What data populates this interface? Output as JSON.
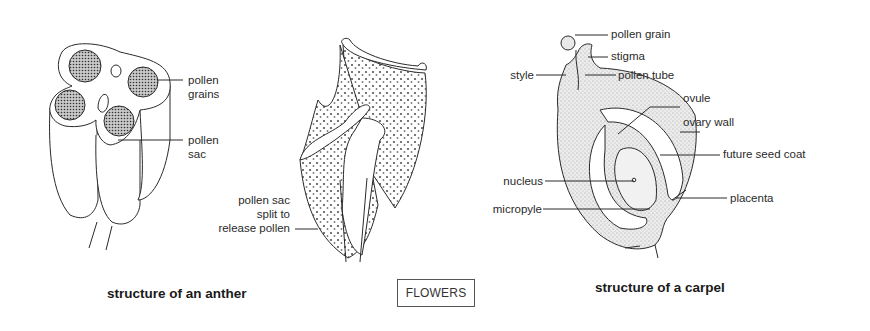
{
  "section_tag": "FLOWERS",
  "figures": [
    {
      "id": "anther",
      "caption": "structure of an anther",
      "labels": {
        "pollen_grains": [
          "pollen",
          "grains"
        ],
        "pollen_sac": [
          "pollen",
          "sac"
        ]
      }
    },
    {
      "id": "dehisced-anther",
      "caption": "",
      "labels": {
        "split": [
          "pollen sac",
          "split to",
          "release pollen"
        ]
      }
    },
    {
      "id": "carpel",
      "caption": "structure of a carpel",
      "labels": {
        "pollen_grain": "pollen grain",
        "stigma": "stigma",
        "style": "style",
        "pollen_tube": "pollen tube",
        "ovule": "ovule",
        "ovary_wall": "ovary wall",
        "future_seed_coat": "future seed coat",
        "nucleus": "nucleus",
        "placenta": "placenta",
        "micropyle": "micropyle"
      }
    }
  ],
  "colors": {
    "ink": "#2a2a2a",
    "stipple": "#d8d8d8",
    "background": "#ffffff"
  }
}
